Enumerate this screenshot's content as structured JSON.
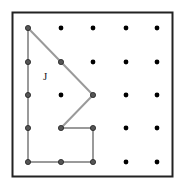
{
  "diagram": {
    "type": "geoboard",
    "grid": {
      "columns": 5,
      "rows": 5
    },
    "polygon": {
      "label": "J",
      "vertices": [
        [
          0,
          0
        ],
        [
          1,
          1
        ],
        [
          2,
          2
        ],
        [
          1,
          3
        ],
        [
          2,
          3
        ],
        [
          2,
          4
        ],
        [
          1,
          4
        ],
        [
          0,
          4
        ],
        [
          0,
          3
        ],
        [
          0,
          2
        ],
        [
          0,
          1
        ]
      ]
    },
    "colors": {
      "dot": "#000000",
      "polygon_stroke": "#9a9a9a",
      "border": "#222222"
    }
  }
}
